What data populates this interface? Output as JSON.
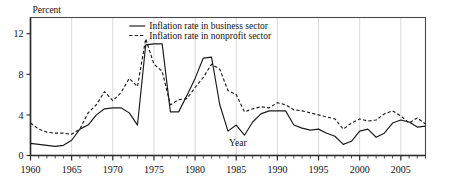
{
  "chart_data": {
    "type": "line",
    "title": "",
    "xlabel": "Year",
    "ylabel": "Percent",
    "xlim": [
      1960,
      2008
    ],
    "ylim": [
      0,
      13.6
    ],
    "yticks": [
      0,
      4,
      8,
      12
    ],
    "ytick_labels": [
      "0",
      "4",
      "8",
      "12"
    ],
    "xticks": [
      1960,
      1965,
      1970,
      1975,
      1980,
      1985,
      1990,
      1995,
      2000,
      2005
    ],
    "xtick_labels": [
      "1960",
      "1965",
      "1970",
      "1975",
      "1980",
      "1985",
      "1990",
      "1995",
      "2000",
      "2005"
    ],
    "minor_xtick_interval": 1,
    "grid": "vertical-major-only",
    "legend_position": "top-right-inside",
    "x": [
      1960,
      1961,
      1962,
      1963,
      1964,
      1965,
      1966,
      1967,
      1968,
      1969,
      1970,
      1971,
      1972,
      1973,
      1974,
      1975,
      1976,
      1977,
      1978,
      1979,
      1980,
      1981,
      1982,
      1983,
      1984,
      1985,
      1986,
      1987,
      1988,
      1989,
      1990,
      1991,
      1992,
      1993,
      1994,
      1995,
      1996,
      1997,
      1998,
      1999,
      2000,
      2001,
      2002,
      2003,
      2004,
      2005,
      2006,
      2007,
      2008
    ],
    "series": [
      {
        "name": "Inflation rate in business sector",
        "style": "solid",
        "color": "#1a1a1a",
        "values": [
          1.2,
          1.1,
          1.0,
          0.9,
          1.0,
          1.5,
          2.6,
          3.0,
          4.0,
          4.6,
          4.7,
          4.7,
          4.2,
          3.0,
          10.9,
          11.0,
          11.0,
          4.3,
          4.3,
          5.9,
          7.6,
          9.6,
          9.7,
          5.0,
          2.4,
          3.0,
          2.0,
          3.3,
          4.1,
          4.4,
          4.4,
          4.4,
          3.0,
          2.7,
          2.5,
          2.6,
          2.2,
          1.9,
          1.1,
          1.4,
          2.4,
          2.6,
          1.8,
          2.2,
          3.2,
          3.5,
          3.3,
          2.8,
          2.9
        ]
      },
      {
        "name": "Inflation rate in nonprofit sector",
        "style": "dashed",
        "color": "#1a1a1a",
        "values": [
          3.2,
          2.6,
          2.3,
          2.2,
          2.2,
          2.1,
          2.6,
          4.2,
          5.0,
          6.3,
          5.4,
          6.2,
          7.6,
          6.8,
          11.5,
          9.0,
          8.3,
          5.0,
          5.5,
          5.6,
          6.7,
          7.7,
          9.0,
          8.5,
          6.4,
          6.0,
          4.3,
          4.6,
          4.8,
          4.7,
          5.2,
          5.0,
          4.5,
          4.4,
          4.2,
          4.0,
          3.8,
          3.6,
          2.6,
          3.2,
          3.6,
          3.4,
          3.5,
          4.1,
          4.4,
          3.9,
          3.2,
          3.7,
          3.1
        ]
      }
    ]
  },
  "legend": {
    "items": [
      {
        "label": "Inflation rate in business sector",
        "style": "solid"
      },
      {
        "label": "Inflation rate in nonprofit sector",
        "style": "dashed"
      }
    ]
  }
}
